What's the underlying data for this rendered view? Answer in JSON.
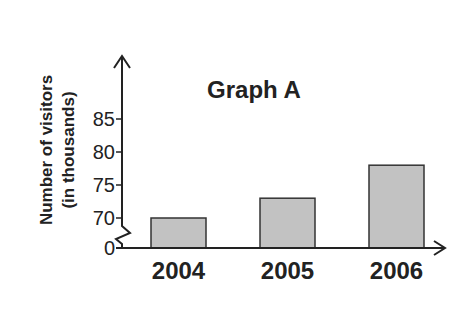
{
  "chart_data": {
    "type": "bar",
    "title": "Graph A",
    "xlabel": "",
    "ylabel": "Number of visitors (in thousands)",
    "ylabel_lines": [
      "Number of visitors",
      "(in thousands)"
    ],
    "categories": [
      "2004",
      "2005",
      "2006"
    ],
    "values": [
      70,
      73,
      78
    ],
    "y_ticks": [
      "0",
      "70",
      "75",
      "80",
      "85"
    ],
    "ylim": [
      70,
      85
    ],
    "axis_break": true,
    "grid": false,
    "legend": null,
    "bar_color": "#c2c2c2",
    "bar_edge_color": "#333333"
  }
}
